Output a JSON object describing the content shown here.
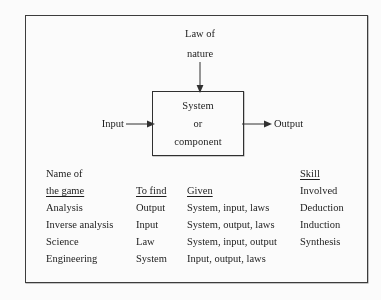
{
  "diagram": {
    "top_input": {
      "line1": "Law of",
      "line2": "nature"
    },
    "system_box": {
      "line1": "System",
      "line2": "or",
      "line3": "component"
    },
    "left_input_label": "Input",
    "right_output_label": "Output"
  },
  "table": {
    "header_row_1": {
      "name_of_the_game": "Name of",
      "skill_involved": "Skill"
    },
    "header_row_2": {
      "name_of_the_game": "the game",
      "to_find": "To find",
      "given": "Given",
      "skill_involved": "Involved"
    },
    "rows": [
      {
        "name_of_the_game": "Analysis",
        "to_find": "Output",
        "given": "System, input, laws",
        "skill_involved": "Deduction"
      },
      {
        "name_of_the_game": "Inverse analysis",
        "to_find": "Input",
        "given": "System, output, laws",
        "skill_involved": "Induction"
      },
      {
        "name_of_the_game": "Science",
        "to_find": "Law",
        "given": "System, input, output",
        "skill_involved": "Synthesis"
      },
      {
        "name_of_the_game": "Engineering",
        "to_find": "System",
        "given": "Input, output, laws",
        "skill_involved": ""
      }
    ]
  },
  "colors": {
    "ink": "#1a1a1a",
    "rule": "#2e2e2e",
    "paper": "#ffffff"
  }
}
